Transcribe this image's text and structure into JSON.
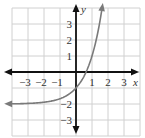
{
  "chart_data": {
    "type": "line",
    "title": "",
    "xlabel": "x",
    "ylabel": "y",
    "xlim": [
      -4,
      4
    ],
    "ylim": [
      -4,
      4
    ],
    "grid": true,
    "x_ticks": [
      {
        "value": -3,
        "label": "−3"
      },
      {
        "value": -2,
        "label": "−2"
      },
      {
        "value": -1,
        "label": "−1"
      },
      {
        "value": 1,
        "label": "1"
      },
      {
        "value": 2,
        "label": "2"
      },
      {
        "value": 3,
        "label": "3"
      }
    ],
    "y_ticks": [
      {
        "value": 3,
        "label": "3"
      },
      {
        "value": 2,
        "label": "2"
      },
      {
        "value": 1,
        "label": "1"
      },
      {
        "value": -2,
        "label": "−2"
      },
      {
        "value": -3,
        "label": "−3"
      }
    ],
    "series": [
      {
        "name": "exponential curve",
        "color": "#7a7a7a",
        "asymptote_y": -2,
        "x": [
          -4.3,
          -3,
          -2,
          -1,
          -0.5,
          0,
          0.5,
          0.63,
          1,
          1.3,
          1.5,
          1.65
        ],
        "y": [
          -1.99,
          -1.96,
          -1.89,
          -1.67,
          -1.42,
          -1.0,
          -0.27,
          0.0,
          1.0,
          2.17,
          3.2,
          4.13
        ]
      }
    ]
  },
  "style": {
    "grid_color": "#d0d0d0",
    "axis_color": "#111111",
    "curve_color": "#7a7a7a",
    "origin_px": [
      76,
      72
    ],
    "unit_px": 16
  }
}
